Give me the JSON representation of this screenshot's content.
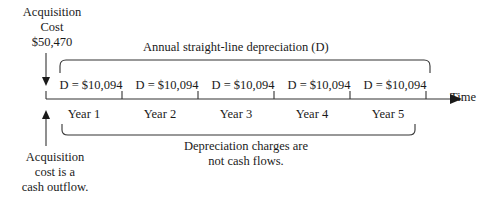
{
  "diagram": {
    "title_block": {
      "acquisition_cost_line1": "Acquisition",
      "acquisition_cost_line2": "Cost",
      "acquisition_cost_line3": "$50,470"
    },
    "annual_depreciation_label": "Annual straight-line depreciation (D)",
    "depreciation_entries": [
      {
        "label": "D = $10,094"
      },
      {
        "label": "D = $10,094"
      },
      {
        "label": "D = $10,094"
      },
      {
        "label": "D = $10,094"
      },
      {
        "label": "D = $10,094"
      }
    ],
    "year_labels": [
      "Year 1",
      "Year 2",
      "Year 3",
      "Year 4",
      "Year 5"
    ],
    "axis_label": "Time",
    "cash_outflow_note": {
      "line1": "Acquisition",
      "line2": "cost is a",
      "line3": "cash outflow."
    },
    "depreciation_note": {
      "line1": "Depreciation charges are",
      "line2": "not cash flows."
    },
    "colors": {
      "ink": "#1a1a1a",
      "line": "#333333",
      "background": "#ffffff"
    }
  }
}
